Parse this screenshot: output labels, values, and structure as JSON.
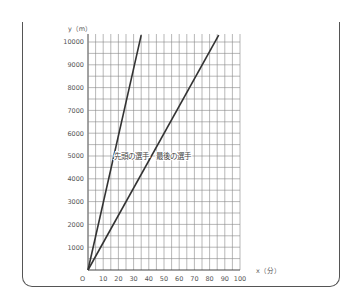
{
  "chart_data": {
    "type": "line",
    "title": "",
    "xlabel": "x（分）",
    "ylabel": "y（m）",
    "xlim": [
      0,
      100
    ],
    "ylim": [
      0,
      10000
    ],
    "grid": true,
    "x_ticks": [
      0,
      10,
      20,
      30,
      40,
      50,
      60,
      70,
      80,
      90,
      100
    ],
    "y_ticks": [
      1000,
      2000,
      3000,
      4000,
      5000,
      6000,
      7000,
      8000,
      9000,
      10000
    ],
    "origin_label": "O",
    "series": [
      {
        "name": "先頭の選手",
        "x": [
          0,
          35
        ],
        "y": [
          0,
          10300
        ]
      },
      {
        "name": "最後の選手",
        "x": [
          0,
          86
        ],
        "y": [
          0,
          10300
        ]
      }
    ],
    "annotations": [
      {
        "text": "先頭の選手",
        "x": 17,
        "y": 5000
      },
      {
        "text": "最後の選手",
        "x": 45,
        "y": 5000
      }
    ]
  }
}
